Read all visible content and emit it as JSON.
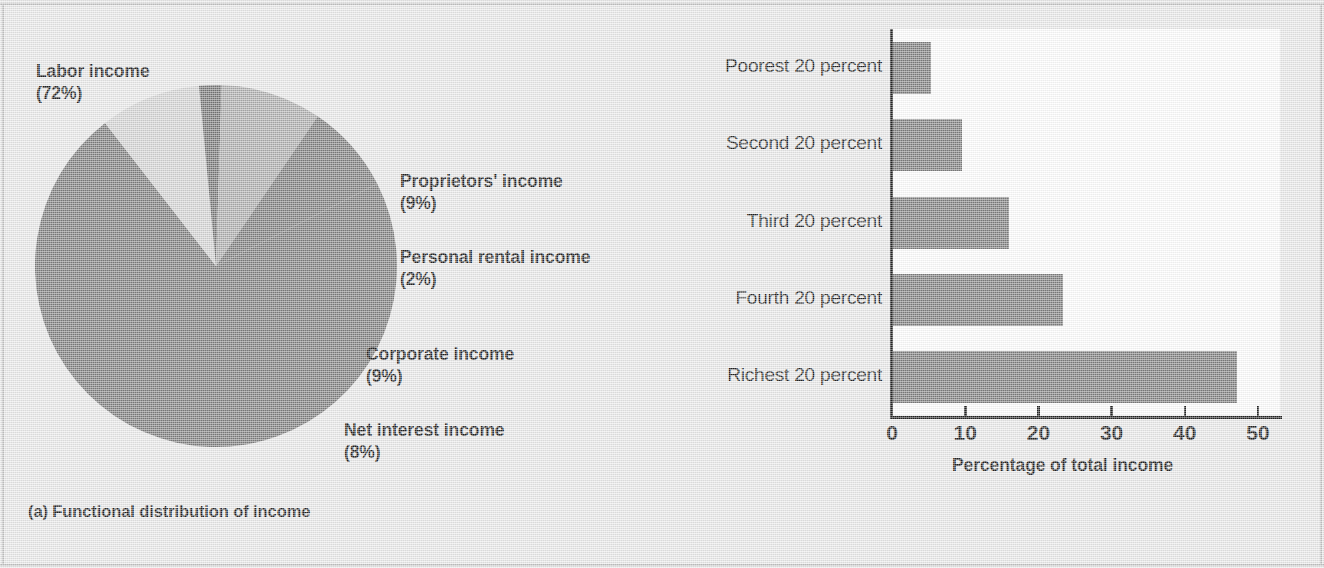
{
  "figure": {
    "background_color": "#e9e9e9",
    "width": 1324,
    "height": 568
  },
  "panel_a": {
    "caption": "(a) Functional distribution of income",
    "labels": {
      "labor_name": "Labor income",
      "labor_value": "(72%)",
      "proprietors_name": "Proprietors' income",
      "proprietors_value": "(9%)",
      "personal_rental_name": "Personal rental income",
      "personal_rental_value": "(2%)",
      "corporate_name": "Corporate income",
      "corporate_value": "(9%)",
      "net_interest_name": "Net interest income",
      "net_interest_value": "(8%)"
    }
  },
  "panel_b": {
    "caption": "(b) Personal distribution of income"
  },
  "chart_data": [
    {
      "type": "pie",
      "title": "(a) Functional distribution of income",
      "labels": [
        "Labor income",
        "Proprietors' income",
        "Personal rental income",
        "Corporate income",
        "Net interest income"
      ],
      "values": [
        72,
        9,
        2,
        9,
        8
      ],
      "value_labels": [
        "(72%)",
        "(9%)",
        "(2%)",
        "(9%)",
        "(8%)"
      ],
      "colors": [
        "#757575",
        "#d2d2d2",
        "#6e6e6e",
        "#a8a8a8",
        "#757575"
      ],
      "units": "percent of total income",
      "start_angle_deg": -27,
      "legend": "labels placed outside slices",
      "center": [
        216,
        271
      ],
      "radius": 181
    },
    {
      "type": "bar",
      "orientation": "horizontal",
      "title": "(b) Personal distribution of income",
      "categories": [
        "Poorest 20 percent",
        "Second 20 percent",
        "Third 20 percent",
        "Fourth 20 percent",
        "Richest 20 percent"
      ],
      "values": [
        5.3,
        9.6,
        16.0,
        23.4,
        47.1
      ],
      "xlabel": "Percentage of total income",
      "ylabel": "",
      "xlim": [
        0,
        53
      ],
      "xticks": [
        0,
        10,
        20,
        30,
        40,
        50
      ],
      "xtick_labels": [
        "0",
        "10",
        "20",
        "30",
        "40",
        "50"
      ],
      "bar_color": "#757575",
      "plot_background": "#ffffff",
      "grid": false,
      "legend": "none"
    }
  ]
}
